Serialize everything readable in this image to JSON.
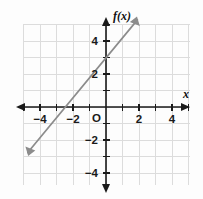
{
  "figure": {
    "background_color": "#fdfdfd",
    "grid_color": "#dcdcdc",
    "axis_color": "#1a1a1a",
    "line_color": "#8c8c8c",
    "label_color": "#1a1a1a"
  },
  "labels": {
    "y_axis_name": "f(x)",
    "x_axis_name": "x",
    "origin": "O"
  },
  "x_ticks": [
    {
      "value": -4,
      "label": "−4"
    },
    {
      "value": -2,
      "label": "−2"
    },
    {
      "value": 2,
      "label": "2"
    },
    {
      "value": 4,
      "label": "4"
    }
  ],
  "y_ticks": [
    {
      "value": 4,
      "label": "4"
    },
    {
      "value": 2,
      "label": "2"
    },
    {
      "value": -2,
      "label": "−2"
    },
    {
      "value": -4,
      "label": "−4"
    }
  ],
  "chart_data": {
    "type": "line",
    "title": "",
    "subtitle": "",
    "xlabel": "x",
    "ylabel": "f(x)",
    "xlim": [
      -5,
      5
    ],
    "ylim": [
      -5,
      5
    ],
    "grid": true,
    "legend": "none",
    "x_ticks": [
      -4,
      -2,
      2,
      4
    ],
    "y_ticks": [
      -4,
      -2,
      2,
      4
    ],
    "x_tick_labels": [
      "−4",
      "−2",
      "2",
      "4"
    ],
    "y_tick_labels": [
      "−4",
      "−2",
      "2",
      "4"
    ],
    "tick_step": 1,
    "major_label_step": 2,
    "arrows_on_axes": true,
    "series": [
      {
        "name": "f(x)",
        "kind": "line",
        "color": "#8c8c8c",
        "slope": 1.2,
        "intercept": 3,
        "equation": "f(x) = 1.2x + 3",
        "x_intercept": -2.5,
        "y_intercept": 3,
        "arrow_both_ends": true,
        "x": [
          -4.8,
          1.9
        ],
        "y": [
          -2.76,
          5.28
        ],
        "points": [
          {
            "x": -2.5,
            "y": 0
          },
          {
            "x": 0,
            "y": 3
          }
        ]
      }
    ]
  }
}
